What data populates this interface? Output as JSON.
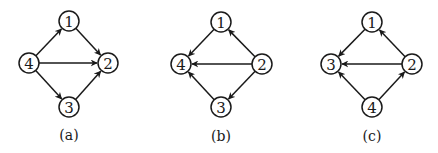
{
  "colors": {
    "stroke": "#1a1a1a",
    "background": "#ffffff",
    "node_fill": "#ffffff"
  },
  "node_radius": 10,
  "graphs": [
    {
      "id": "a",
      "caption": "(a)",
      "caption_pos": [
        69,
        135
      ],
      "nodes": [
        {
          "id": "1",
          "label": "1",
          "x": 69,
          "y": 21
        },
        {
          "id": "2",
          "label": "2",
          "x": 108,
          "y": 63
        },
        {
          "id": "3",
          "label": "3",
          "x": 69,
          "y": 107
        },
        {
          "id": "4",
          "label": "4",
          "x": 29,
          "y": 63
        }
      ],
      "edges": [
        {
          "from": "4",
          "to": "1"
        },
        {
          "from": "4",
          "to": "2"
        },
        {
          "from": "4",
          "to": "3"
        },
        {
          "from": "1",
          "to": "2"
        },
        {
          "from": "3",
          "to": "2"
        }
      ]
    },
    {
      "id": "b",
      "caption": "(b)",
      "caption_pos": [
        221,
        136
      ],
      "nodes": [
        {
          "id": "1",
          "label": "1",
          "x": 221,
          "y": 22
        },
        {
          "id": "2",
          "label": "2",
          "x": 262,
          "y": 64
        },
        {
          "id": "3",
          "label": "3",
          "x": 221,
          "y": 107
        },
        {
          "id": "4",
          "label": "4",
          "x": 181,
          "y": 64
        }
      ],
      "edges": [
        {
          "from": "1",
          "to": "4"
        },
        {
          "from": "2",
          "to": "4"
        },
        {
          "from": "3",
          "to": "4"
        },
        {
          "from": "2",
          "to": "1"
        },
        {
          "from": "2",
          "to": "3"
        }
      ]
    },
    {
      "id": "c",
      "caption": "(c)",
      "caption_pos": [
        372,
        136
      ],
      "nodes": [
        {
          "id": "1",
          "label": "1",
          "x": 372,
          "y": 22
        },
        {
          "id": "2",
          "label": "2",
          "x": 412,
          "y": 64
        },
        {
          "id": "3",
          "label": "3",
          "x": 331,
          "y": 64
        },
        {
          "id": "4",
          "label": "4",
          "x": 372,
          "y": 107
        }
      ],
      "edges": [
        {
          "from": "1",
          "to": "3"
        },
        {
          "from": "2",
          "to": "3"
        },
        {
          "from": "4",
          "to": "3"
        },
        {
          "from": "2",
          "to": "1"
        },
        {
          "from": "4",
          "to": "2"
        }
      ]
    }
  ]
}
